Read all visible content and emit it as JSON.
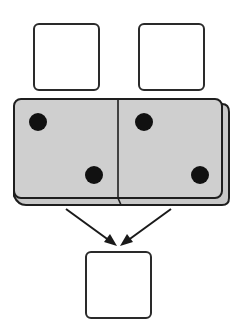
{
  "diagram": {
    "top_boxes": [
      {
        "id": "left",
        "value": ""
      },
      {
        "id": "right",
        "value": ""
      }
    ],
    "domino": {
      "left_half_pips": 2,
      "right_half_pips": 2,
      "face_color": "#cfcfcf",
      "pip_color": "#111111"
    },
    "bottom_box": {
      "value": ""
    },
    "arrows": [
      {
        "from": "domino-left",
        "to": "bottom-box"
      },
      {
        "from": "domino-right",
        "to": "bottom-box"
      }
    ]
  }
}
